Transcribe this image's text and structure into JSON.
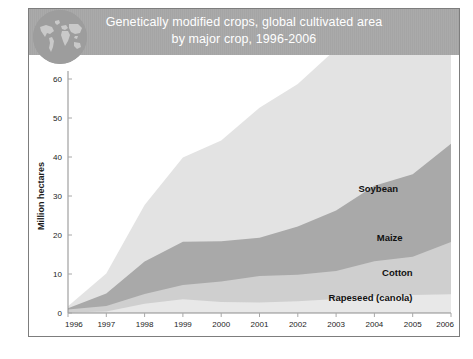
{
  "header": {
    "title_line1": "Genetically modified crops, global cultivated area",
    "title_line2": "by major crop, 1996-2006",
    "band_color": "#a5a5a5",
    "title_color": "#ffffff",
    "globe_icon": "globe-world-map-icon",
    "globe_color": "#9d9d9d"
  },
  "chart_data": {
    "type": "area",
    "stacked": true,
    "title": "Genetically modified crops, global cultivated area by major crop, 1996-2006",
    "xlabel": "",
    "ylabel": "Million hectares",
    "x": [
      1996,
      1997,
      1998,
      1999,
      2000,
      2001,
      2002,
      2003,
      2004,
      2005,
      2006
    ],
    "xlim": [
      1996,
      2006
    ],
    "ylim": [
      0,
      60
    ],
    "yticks": [
      0,
      10,
      20,
      30,
      40,
      50,
      60
    ],
    "xticks": [
      "1996",
      "1997",
      "1998",
      "1999",
      "2000",
      "2001",
      "2002",
      "2003",
      "2004",
      "2005",
      "2006"
    ],
    "grid": false,
    "legend": "inline-labels",
    "series": [
      {
        "name": "Rapeseed (canola)",
        "color": "#e8e8e8",
        "order": 1,
        "values": [
          0.1,
          0.4,
          2.4,
          3.5,
          2.8,
          2.7,
          3.0,
          3.6,
          4.3,
          4.6,
          4.8
        ]
      },
      {
        "name": "Cotton",
        "color": "#cfcfcf",
        "order": 2,
        "values": [
          0.8,
          1.4,
          2.5,
          3.7,
          5.3,
          6.8,
          6.8,
          7.2,
          9.0,
          9.8,
          13.4
        ]
      },
      {
        "name": "Maize",
        "color": "#a9a9a9",
        "order": 3,
        "values": [
          0.3,
          3.2,
          8.3,
          11.1,
          10.3,
          9.8,
          12.4,
          15.5,
          19.3,
          21.2,
          25.2
        ]
      },
      {
        "name": "Soybean",
        "color": "#e3e3e3",
        "order": 4,
        "values": [
          0.5,
          5.1,
          14.5,
          21.6,
          25.8,
          33.3,
          36.5,
          41.4,
          48.4,
          54.4,
          58.6
        ]
      }
    ],
    "totals": [
      1.7,
      10.1,
      27.7,
      39.9,
      44.2,
      52.6,
      58.7,
      67.7,
      81.0,
      90.0,
      102.0
    ],
    "units": "Million hectares",
    "series_label_positions": [
      {
        "name": "Soybean",
        "x": 2004.1,
        "y": 31.0
      },
      {
        "name": "Maize",
        "x": 2004.4,
        "y": 18.5
      },
      {
        "name": "Cotton",
        "x": 2004.6,
        "y": 9.5
      },
      {
        "name": "Rapeseed (canola)",
        "x": 2003.9,
        "y": 3.0
      }
    ]
  }
}
